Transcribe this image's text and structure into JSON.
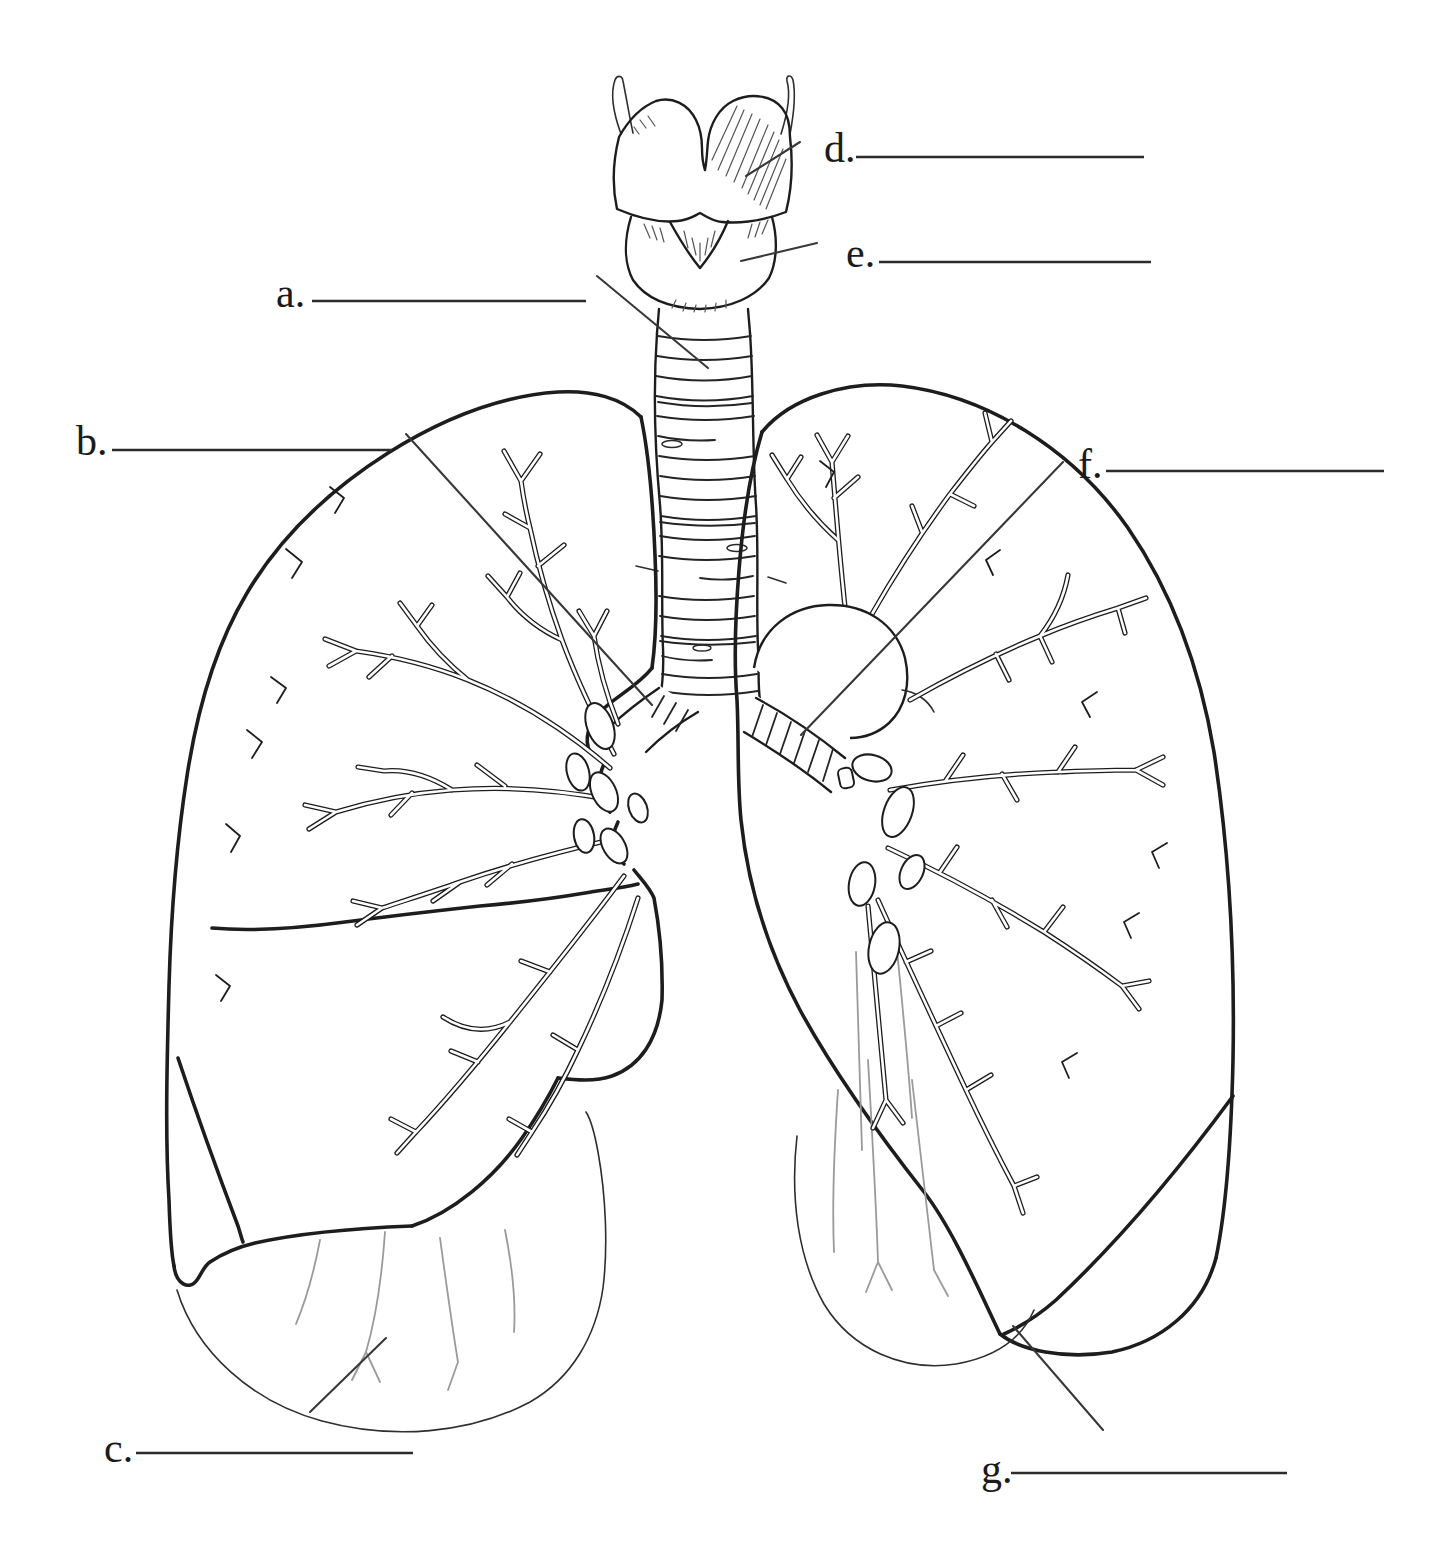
{
  "page": {
    "background": "#ffffff",
    "ink": "#1d1d1d",
    "light_ink": "#9a9a9a"
  },
  "labels": [
    {
      "letter": "a.",
      "answer": ""
    },
    {
      "letter": "b.",
      "answer": ""
    },
    {
      "letter": "c.",
      "answer": ""
    },
    {
      "letter": "d.",
      "answer": ""
    },
    {
      "letter": "e.",
      "answer": ""
    },
    {
      "letter": "f.",
      "answer": ""
    },
    {
      "letter": "g.",
      "answer": ""
    }
  ]
}
